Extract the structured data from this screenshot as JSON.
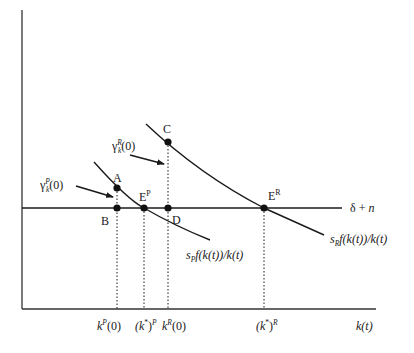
{
  "diagram": {
    "type": "growth-model phase diagram",
    "colors": {
      "ink": "#1a1a1a",
      "background": "#ffffff"
    },
    "axes": {
      "x_label": "k(t)",
      "y_label": ""
    },
    "horizontal_line": {
      "label": "δ + n",
      "label_delta": "δ",
      "label_plus": " + ",
      "label_n": "n"
    },
    "curves": {
      "poor": {
        "label_s": "s",
        "label_sub": "P",
        "label_rest": "f(k(t))/k(t)"
      },
      "rich": {
        "label_s": "s",
        "label_sub": "R",
        "label_rest": "f(k(t))/k(t)"
      }
    },
    "points": {
      "A": "A",
      "B": "B",
      "C": "C",
      "D": "D",
      "EP_base": "E",
      "EP_sup": "P",
      "ER_base": "E",
      "ER_sup": "R"
    },
    "growth_labels": {
      "poor": {
        "gamma": "γ",
        "sub": "k",
        "sup": "P",
        "arg": "(0)"
      },
      "rich": {
        "gamma": "γ",
        "sub": "k",
        "sup": "R",
        "arg": "(0)"
      }
    },
    "x_ticks": {
      "kP0": {
        "k": "k",
        "sup": "P",
        "arg": "(0)"
      },
      "kstarP": {
        "open": "(k",
        "star": "*",
        "close": ")",
        "sup": "P"
      },
      "kR0": {
        "k": "k",
        "sup": "R",
        "arg": "(0)"
      },
      "kstarR": {
        "open": "(k",
        "star": "*",
        "close": ")",
        "sup": "R"
      }
    }
  }
}
